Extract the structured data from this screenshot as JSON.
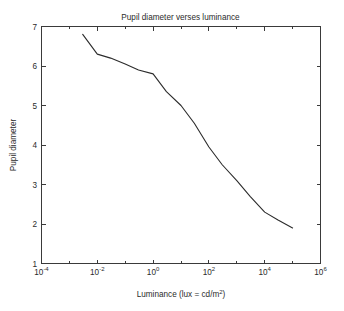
{
  "chart_data": {
    "type": "line",
    "title": "Pupil diameter verses luminance",
    "xlabel": "Luminance (lux = cd/m²)",
    "ylabel": "Pupil diameter",
    "xscale": "log",
    "yscale": "linear",
    "xlim": [
      0.0001,
      1000000
    ],
    "ylim": [
      1,
      7
    ],
    "grid": false,
    "legend": null,
    "x_tick_labels": [
      "10⁻⁴",
      "10⁻²",
      "10⁰",
      "10²",
      "10⁴",
      "10⁶"
    ],
    "x_tick_bases": [
      "10",
      "10",
      "10",
      "10",
      "10",
      "10"
    ],
    "x_tick_exponents": [
      "-4",
      "-2",
      "0",
      "2",
      "4",
      "6"
    ],
    "x_tick_values": [
      0.0001,
      0.01,
      1,
      100,
      10000,
      1000000
    ],
    "y_tick_labels": [
      "1",
      "2",
      "3",
      "4",
      "5",
      "6",
      "7"
    ],
    "y_tick_values": [
      1,
      2,
      3,
      4,
      5,
      6,
      7
    ],
    "series": [
      {
        "name": "pupil diameter",
        "color": "#2b2b2b",
        "x": [
          0.003,
          0.01,
          0.03,
          0.1,
          0.3,
          1,
          3,
          10,
          30,
          100,
          300,
          1000,
          3000,
          10000,
          30000,
          100000
        ],
        "y": [
          6.8,
          6.3,
          6.2,
          6.05,
          5.9,
          5.8,
          5.35,
          5.0,
          4.55,
          3.95,
          3.5,
          3.1,
          2.7,
          2.3,
          2.1,
          1.9
        ]
      }
    ],
    "annotations": []
  },
  "figure": {
    "background_color": "#ffffff",
    "axis_color": "#3a3a3a",
    "text_color": "#2b2b2b"
  }
}
